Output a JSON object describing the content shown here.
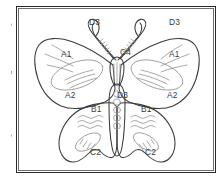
{
  "page": {
    "background_color": "#ffffff",
    "width": 221,
    "height": 180
  },
  "margin_text": {
    "description": "cut-off text column at left edge of scanned page",
    "lines": [
      "l",
      "e",
      "t",
      "i",
      "l",
      "n",
      ".",
      "",
      "e"
    ]
  },
  "figure": {
    "name": "butterfly-diagram",
    "frame": {
      "border_color": "#2b2b2b",
      "inner_border_color": "#6f6f6f",
      "background": "#ffffff"
    },
    "outline_color": "#3a3a3a",
    "detail_color": "#9a9a9a",
    "labels": [
      {
        "id": "antenna-left",
        "text": "D3",
        "x": 72,
        "y": 18
      },
      {
        "id": "antenna-right",
        "text": "D3",
        "x": 152,
        "y": 18
      },
      {
        "id": "head",
        "text": "C4",
        "x": 103,
        "y": 48
      },
      {
        "id": "forewing-left",
        "text": "A1",
        "x": 44,
        "y": 50
      },
      {
        "id": "forewing-right",
        "text": "A1",
        "x": 152,
        "y": 50
      },
      {
        "id": "hindmargin-left",
        "text": "A2",
        "x": 48,
        "y": 91
      },
      {
        "id": "hindmargin-right",
        "text": "A2",
        "x": 150,
        "y": 91
      },
      {
        "id": "abdomen",
        "text": "D3",
        "x": 100,
        "y": 91
      },
      {
        "id": "hindwing-left",
        "text": "B1",
        "x": 74,
        "y": 105
      },
      {
        "id": "hindwing-right",
        "text": "B1",
        "x": 124,
        "y": 105
      },
      {
        "id": "spot-left",
        "text": "C2",
        "x": 73,
        "y": 148
      },
      {
        "id": "spot-right",
        "text": "C2",
        "x": 128,
        "y": 148
      }
    ]
  }
}
